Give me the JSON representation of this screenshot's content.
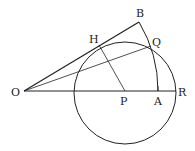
{
  "diagram": {
    "type": "geometry",
    "points": {
      "O": {
        "label": "O",
        "x": 24,
        "y": 91
      },
      "P": {
        "label": "P",
        "x": 125,
        "y": 91
      },
      "A": {
        "label": "A",
        "x": 158,
        "y": 91
      },
      "R": {
        "label": "R",
        "x": 176,
        "y": 91
      },
      "B": {
        "label": "B",
        "x": 139,
        "y": 22
      },
      "H": {
        "label": "H",
        "x": 99,
        "y": 45
      },
      "Q": {
        "label": "Q",
        "x": 151,
        "y": 46
      }
    },
    "circle": {
      "center": "P",
      "radius": 51
    },
    "arc": {
      "center": "O",
      "from": "A",
      "to": "B"
    },
    "segments": [
      "OB",
      "OQ",
      "OR",
      "PH",
      "AB-arc"
    ],
    "stroke_color": "#222222"
  }
}
